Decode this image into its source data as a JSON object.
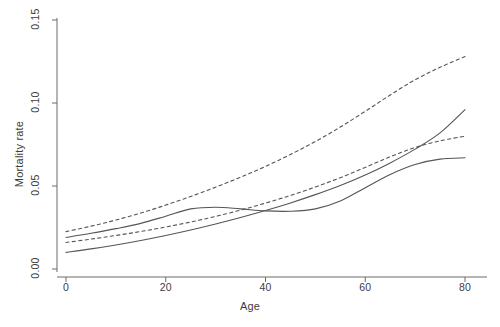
{
  "chart_data": {
    "type": "line",
    "title": "",
    "xlabel": "Age",
    "ylabel": "Mortality rate",
    "xlim": [
      0,
      80
    ],
    "ylim": [
      0.0,
      0.15
    ],
    "xticks": [
      0,
      20,
      40,
      60,
      80
    ],
    "xticklabels": [
      "0",
      "20",
      "40",
      "60",
      "80"
    ],
    "yticks": [
      0.0,
      0.05,
      0.1,
      0.15
    ],
    "yticklabels": [
      "0.00",
      "0.05",
      "0.10",
      "0.15"
    ],
    "grid": false,
    "legend": "none",
    "x": [
      0,
      5,
      10,
      15,
      20,
      25,
      30,
      35,
      40,
      45,
      50,
      55,
      60,
      65,
      70,
      75,
      80
    ],
    "series": [
      {
        "name": "parametric-fit",
        "style": "solid",
        "color": "#555555",
        "values": [
          0.01,
          0.0121,
          0.0145,
          0.0172,
          0.0202,
          0.0235,
          0.0271,
          0.031,
          0.0352,
          0.0398,
          0.0448,
          0.0503,
          0.0566,
          0.0639,
          0.0722,
          0.082,
          0.096
        ]
      },
      {
        "name": "nonparametric-smooth",
        "style": "solid",
        "color": "#555555",
        "values": [
          0.019,
          0.0215,
          0.0243,
          0.0275,
          0.0318,
          0.0362,
          0.0372,
          0.0362,
          0.035,
          0.0348,
          0.0362,
          0.041,
          0.049,
          0.057,
          0.063,
          0.0662,
          0.067
        ]
      },
      {
        "name": "upper-confidence-band",
        "style": "dashed",
        "color": "#555555",
        "values": [
          0.0225,
          0.0258,
          0.0295,
          0.0337,
          0.0385,
          0.0437,
          0.0493,
          0.0553,
          0.0618,
          0.069,
          0.0768,
          0.0855,
          0.095,
          0.1048,
          0.114,
          0.1215,
          0.128
        ]
      },
      {
        "name": "lower-confidence-band",
        "style": "dashed",
        "color": "#555555",
        "values": [
          0.016,
          0.018,
          0.0202,
          0.0226,
          0.0253,
          0.0283,
          0.0317,
          0.0355,
          0.0397,
          0.0443,
          0.0494,
          0.055,
          0.0612,
          0.0676,
          0.0732,
          0.0772,
          0.08
        ]
      }
    ]
  },
  "axes": {
    "x_axis_name": "Age",
    "y_axis_name": "Mortality rate"
  },
  "colors": {
    "axis": "#6b6b6b",
    "line": "#555555",
    "background": "#ffffff",
    "text": "#3d3d3d"
  }
}
